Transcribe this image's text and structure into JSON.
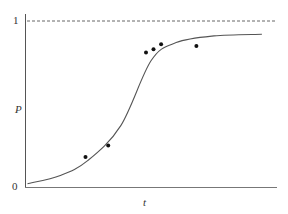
{
  "chart_data": {
    "type": "line",
    "title": "",
    "xlabel": "t",
    "ylabel": "P",
    "ytick_labels": [
      "0",
      "1"
    ],
    "ylim": [
      0,
      1
    ],
    "grid": false,
    "legend": null,
    "asymptote": {
      "y": 1,
      "style": "dashed"
    },
    "series": [
      {
        "name": "logistic fit",
        "kind": "line",
        "x": [
          0.01,
          0.14,
          0.25,
          0.38,
          0.5,
          0.6,
          0.75,
          0.94
        ],
        "values": [
          0.02,
          0.07,
          0.16,
          0.37,
          0.76,
          0.87,
          0.91,
          0.92
        ]
      },
      {
        "name": "observations",
        "kind": "scatter",
        "x": [
          0.24,
          0.33,
          0.48,
          0.51,
          0.54,
          0.68
        ],
        "values": [
          0.18,
          0.25,
          0.81,
          0.83,
          0.86,
          0.85
        ]
      }
    ]
  },
  "labels": {
    "y_top": "1",
    "y_bottom": "0",
    "y_axis": "P",
    "x_axis": "t"
  }
}
